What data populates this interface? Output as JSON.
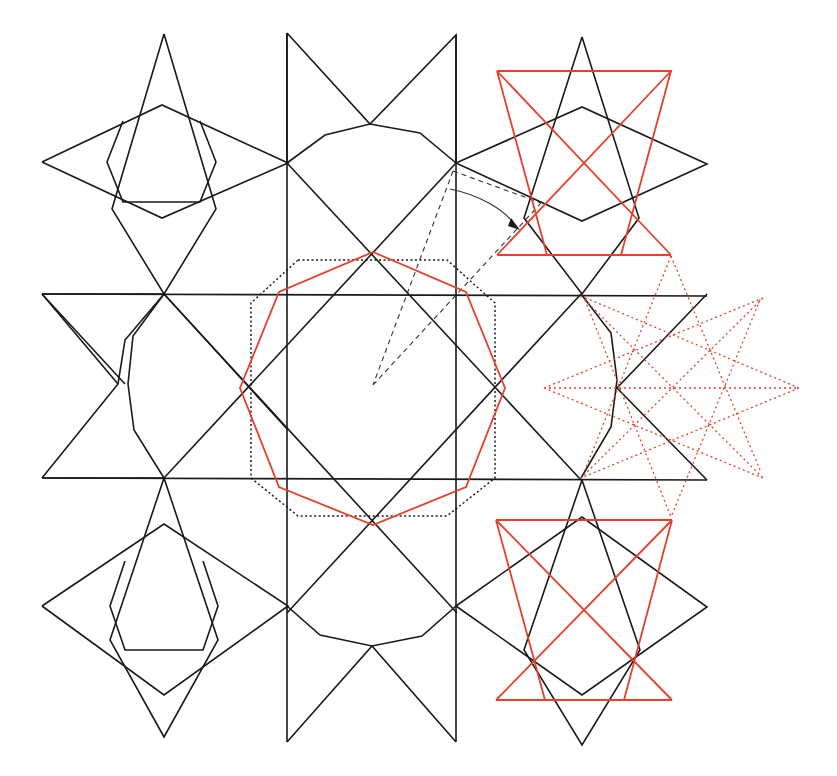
{
  "figure": {
    "colors": {
      "primary": "#1a1a1a",
      "accent": "#e8402a",
      "background": "#ffffff"
    }
  },
  "black_paths": [
    {
      "name": "tl-star-vertical",
      "points": "164,34 216,209 164,294 112,209 164,34"
    },
    {
      "name": "tl-star-horizontal",
      "points": "42,162 162,105 288,163 162,218 42,162"
    },
    {
      "name": "tl-inner-oct",
      "points": "123,121 107,162 123,202 200,202 216,162 200,121"
    },
    {
      "name": "top-bowtie",
      "points": "287,33 287,163 M287,33 370,124 456,35 456,163"
    },
    {
      "name": "top-dome",
      "points": "287,163 325,135 370,124 420,133 456,163"
    },
    {
      "name": "ml-left-star",
      "points": "42,294 164,294 125,340 118,384 42,478 M42,294 125,384 M164,294 288,430"
    },
    {
      "name": "ml-left-star-b",
      "points": "164,294 133,336 128,384 134,430 164,478 M42,478 164,478 M118,384 42,294"
    },
    {
      "name": "big-horizontal-top",
      "points": "42,294 707,296"
    },
    {
      "name": "big-horizontal-bottom",
      "points": "42,478 707,480"
    },
    {
      "name": "big-vertical-left",
      "points": "287,33 287,742"
    },
    {
      "name": "big-vertical-right",
      "points": "456,35 456,742"
    },
    {
      "name": "diag-1",
      "points": "164,294 457,613"
    },
    {
      "name": "diag-2",
      "points": "581,294 287,613"
    },
    {
      "name": "diag-3",
      "points": "287,163 581,480"
    },
    {
      "name": "diag-4",
      "points": "456,163 164,478"
    },
    {
      "name": "mr-right-star",
      "points": "581,294 611,333 617,380 611,427 581,478 M707,294 617,388 707,480"
    },
    {
      "name": "tr-star-vertical",
      "points": "582,37 639,218 582,294 524,218 582,37"
    },
    {
      "name": "tr-star-horizontal",
      "points": "456,163 582,107 707,164 582,221 456,163"
    },
    {
      "name": "bl-star-vertical",
      "points": "164,478 218,640 164,737 110,640 164,478"
    },
    {
      "name": "bl-star-horizontal",
      "points": "42,606 164,524 288,606 164,695 42,606"
    },
    {
      "name": "bl-inner-oct",
      "points": "125,561 110,606 125,650 203,650 218,606 203,561"
    },
    {
      "name": "bottom-dome",
      "points": "287,606 320,635 372,646 422,636 456,606"
    },
    {
      "name": "bottom-bowtie",
      "points": "287,742 372,646 456,742"
    },
    {
      "name": "br-star-vertical",
      "points": "582,480 640,650 582,745 524,650 582,480"
    },
    {
      "name": "br-star-horizontal",
      "points": "456,606 582,517 707,607 582,695 456,606"
    }
  ],
  "red_paths": [
    {
      "name": "central-decagon",
      "points": "373,252 466,292 505,388 466,487 373,525 279,487 240,388 279,292 373,252"
    },
    {
      "name": "tr-red-star",
      "points": "497,71 671,255 M671,71 497,255 M497,71 672,71 M497,255 671,255 M497,71 547,255 M671,71 621,255"
    },
    {
      "name": "br-red-star",
      "points": "496,520 672,520 M496,520 672,700 M672,520 496,700 M496,700 672,700 M496,520 545,700 M672,520 624,700"
    }
  ],
  "red_dotted_paths": [
    {
      "name": "mr-rotated-star",
      "points": "544,388 799,388 M581,296 763,478 M763,298 581,478 M671,256 585,470 M671,256 760,470 M544,388 763,298 M544,388 763,478 M799,388 581,296 M799,388 581,478 M585,300 671,517 M760,300 671,517"
    }
  ],
  "black_dotted_paths": [
    {
      "name": "central-dodecagon",
      "points": "298,260 447,260 495,303 495,478 447,516 298,516 251,478 251,303 298,260"
    }
  ],
  "dashed_paths": [
    {
      "name": "rotation-guide",
      "points": "453,171 373,385 M373,385 541,203 M453,171 541,203"
    }
  ],
  "arrow": {
    "name": "rotation-arrow",
    "path": "M450,189 C480,195 505,210 516,226",
    "head": "511,218 520,230 508,226"
  }
}
